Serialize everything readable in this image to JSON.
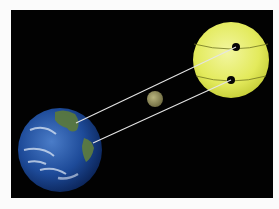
{
  "figure": {
    "background_color": "#020202",
    "page_color": "#fbfbfb",
    "bodies": [
      {
        "name": "sun",
        "color": "#e8ee6a",
        "cx": 231,
        "cy": 60,
        "r": 38
      },
      {
        "name": "moon",
        "color": "#9a9660",
        "cx": 155,
        "cy": 99,
        "r": 8
      },
      {
        "name": "earth",
        "color": "#1f4fa0",
        "cx": 60,
        "cy": 150,
        "r": 42
      }
    ],
    "sun_spots": [
      {
        "cx": 236,
        "cy": 47,
        "r": 4
      },
      {
        "cx": 231,
        "cy": 80,
        "r": 4
      }
    ],
    "sight_lines": [
      {
        "from": [
          76,
          123
        ],
        "to": [
          236,
          47
        ]
      },
      {
        "from": [
          93,
          143
        ],
        "to": [
          231,
          80
        ]
      }
    ]
  }
}
